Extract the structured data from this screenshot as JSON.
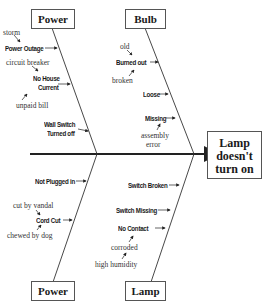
{
  "effect": {
    "line1": "Lamp",
    "line2": "doesn't",
    "line3": "turn on"
  },
  "categories": {
    "top_left": "Power",
    "top_right": "Bulb",
    "bottom_left": "Power",
    "bottom_right": "Lamp"
  },
  "top_left_causes": {
    "power_outage": "Power Outage",
    "power_outage_sub": "storm",
    "no_house_current_1": "No House",
    "no_house_current_2": "Current",
    "no_house_sub_1": "circuit breaker",
    "no_house_sub_2": "unpaid bill",
    "wall_switch_1": "Wall Switch",
    "wall_switch_2": "Turned off"
  },
  "top_right_causes": {
    "burned_out": "Burned out",
    "burned_sub_1": "old",
    "burned_sub_2": "broken",
    "loose": "Loose",
    "missing": "Missing",
    "missing_sub_1": "assembly",
    "missing_sub_2": "error"
  },
  "bottom_left_causes": {
    "not_plugged": "Not Plugged in",
    "cord_cut": "Cord Cut",
    "cord_sub_1": "cut by vandal",
    "cord_sub_2": "chewed by dog"
  },
  "bottom_right_causes": {
    "switch_broken": "Switch Broken",
    "switch_missing": "Switch Missing",
    "no_contact": "No Contact",
    "no_contact_sub_1": "corroded",
    "no_contact_sub_2": "high humidity"
  }
}
